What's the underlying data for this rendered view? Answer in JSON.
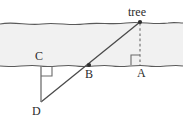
{
  "figure": {
    "kind": "geometry-diagram",
    "width": 183,
    "height": 128,
    "background_color": "#ffffff",
    "band_fill_color": "#f0f0f0",
    "stroke_color": "#595959",
    "label_color": "#2b2b2b"
  },
  "labels": {
    "tree": "tree",
    "point_a": "A",
    "point_b": "B",
    "point_c": "C",
    "point_d": "D"
  },
  "geometry": {
    "surface_upper": {
      "name": "upper-ground-line",
      "style": "wavy-solid",
      "y": 23
    },
    "surface_lower": {
      "name": "lower-ground-line",
      "style": "wavy-solid",
      "y": 65
    },
    "points": {
      "tree_top": {
        "x": 140,
        "y": 22
      },
      "A": {
        "x": 140,
        "y": 65
      },
      "B": {
        "x": 89,
        "y": 65
      },
      "C": {
        "x": 41,
        "y": 65
      },
      "D": {
        "x": 41,
        "y": 102
      }
    },
    "segments": [
      {
        "name": "tree-to-A",
        "style": "dashed-vertical",
        "from": "tree_top",
        "to": "A"
      },
      {
        "name": "C-to-D",
        "style": "solid-vertical",
        "from": "C",
        "to": "D"
      },
      {
        "name": "tree-through-B-to-D",
        "style": "solid-diagonal",
        "from": "tree_top",
        "to": "D"
      }
    ],
    "right_angles": [
      {
        "name": "right-angle-at-A",
        "at": "A",
        "side": "upper-left"
      },
      {
        "name": "right-angle-at-C",
        "at": "C",
        "side": "lower-right"
      }
    ],
    "markers": [
      {
        "name": "dot-tree-top",
        "at": "tree_top"
      },
      {
        "name": "dot-B",
        "at": "B"
      }
    ]
  }
}
